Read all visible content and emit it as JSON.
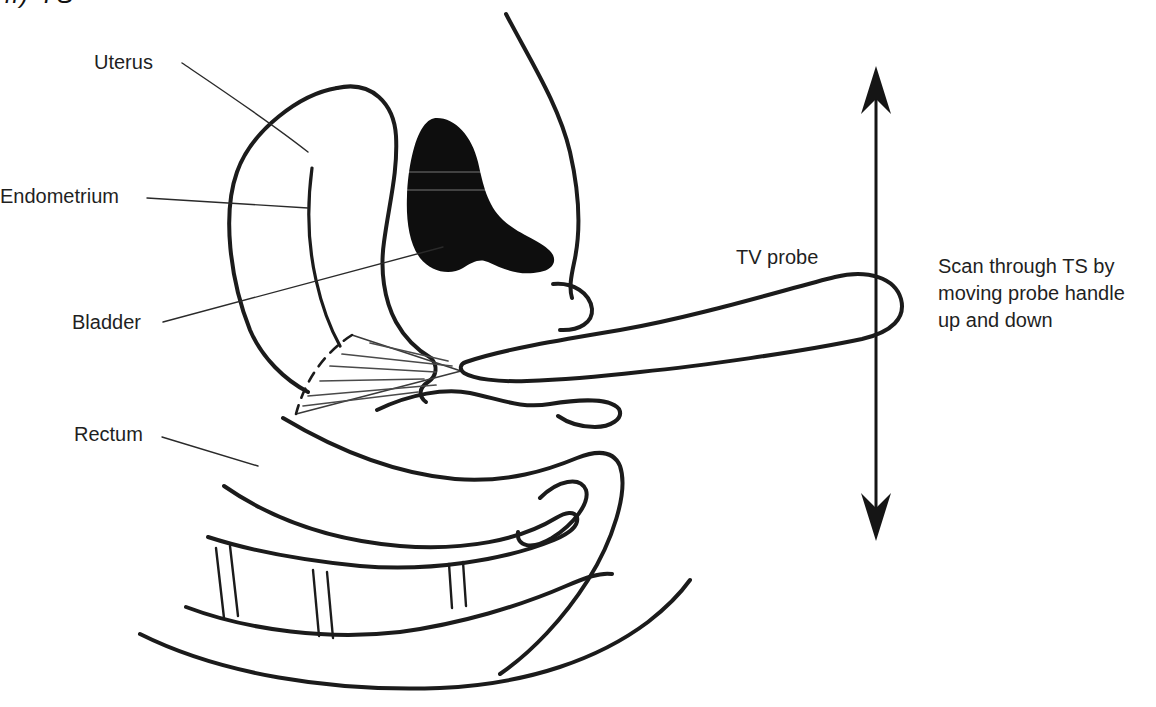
{
  "figure": {
    "corner_label": "ii) TS",
    "labels": {
      "uterus": "Uterus",
      "endometrium": "Endometrium",
      "bladder": "Bladder",
      "rectum": "Rectum",
      "tv_probe": "TV probe"
    },
    "annotation": "Scan through TS by moving probe handle up and down",
    "colors": {
      "ink": "#1b1b1b",
      "paper": "#ffffff",
      "probe_fill": "#f7f7f7",
      "bladder_fill": "#0e0e0e"
    }
  }
}
